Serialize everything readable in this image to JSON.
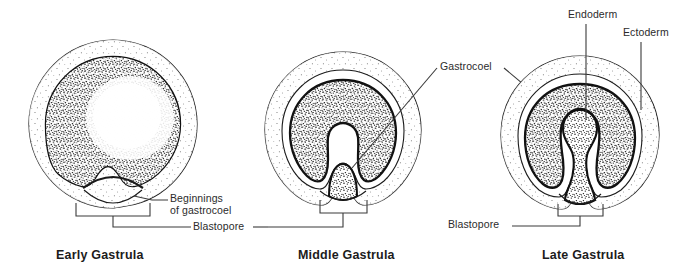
{
  "figure": {
    "background": "#ffffff",
    "ink": "#231f20",
    "stipple_color": "#1a1a1a",
    "panels": [
      {
        "id": "early",
        "caption": "Early Gastrula",
        "center_x": 113,
        "center_y": 124,
        "radius": 84
      },
      {
        "id": "middle",
        "caption": "Middle Gastrula",
        "center_x": 343,
        "center_y": 130,
        "radius": 78
      },
      {
        "id": "late",
        "caption": "Late Gastrula",
        "center_x": 580,
        "center_y": 135,
        "radius": 79
      }
    ],
    "labels": [
      {
        "id": "beginnings",
        "text": "Beginnings\nof gastrocoel"
      },
      {
        "id": "blastopore_left",
        "text": "Blastopore"
      },
      {
        "id": "gastrocoel",
        "text": "Gastrocoel"
      },
      {
        "id": "endoderm",
        "text": "Endoderm"
      },
      {
        "id": "ectoderm",
        "text": "Ectoderm"
      },
      {
        "id": "blastopore_right",
        "text": "Blastopore"
      }
    ],
    "label_text": {
      "beginnings_line1": "Beginnings",
      "beginnings_line2": "of gastrocoel",
      "blastopore_left": "Blastopore",
      "gastrocoel": "Gastrocoel",
      "endoderm": "Endoderm",
      "ectoderm": "Ectoderm",
      "blastopore_right": "Blastopore"
    },
    "captions": {
      "early": "Early Gastrula",
      "middle": "Middle Gastrula",
      "late": "Late Gastrula"
    }
  }
}
